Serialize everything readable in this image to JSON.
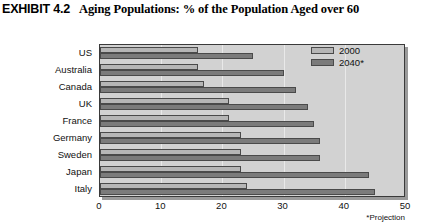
{
  "header": {
    "exhibit_label": "EXHIBIT 4.2",
    "title": "Aging Populations: % of the Population Aged over 60"
  },
  "legend": {
    "items": [
      {
        "label": "2000",
        "color": "#b6b6b6"
      },
      {
        "label": "2040*",
        "color": "#7b7b7b"
      }
    ]
  },
  "footnote": "*Projection",
  "colors": {
    "plot_background": "#d2d2d2",
    "series_2000": "#b6b6b6",
    "series_2040": "#7b7b7b",
    "axis": "#3a3a3a"
  },
  "chart_data": {
    "type": "bar",
    "orientation": "horizontal",
    "title": "Aging Populations: % of the Population Aged over 60",
    "xlabel": "",
    "ylabel": "",
    "xlim": [
      0,
      50
    ],
    "xticks": [
      0,
      10,
      20,
      30,
      40,
      50
    ],
    "grid": true,
    "legend_position": "top-right",
    "annotations": [
      "*Projection"
    ],
    "categories": [
      "US",
      "Australia",
      "Canada",
      "UK",
      "France",
      "Germany",
      "Sweden",
      "Japan",
      "Italy"
    ],
    "series": [
      {
        "name": "2000",
        "values": [
          16,
          16,
          17,
          21,
          21,
          23,
          23,
          23,
          24
        ]
      },
      {
        "name": "2040*",
        "values": [
          25,
          30,
          32,
          34,
          35,
          36,
          36,
          44,
          45
        ]
      }
    ]
  }
}
